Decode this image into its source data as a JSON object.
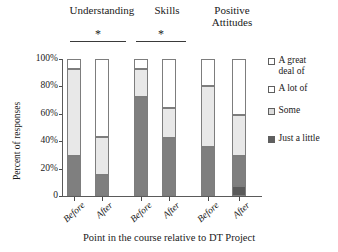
{
  "chart_data": {
    "type": "bar",
    "subtype": "100% stacked bar",
    "title": "",
    "xlabel": "Point in the course relative to DT Project",
    "ylabel": "Percent of responses",
    "ylim": [
      0,
      100
    ],
    "ytick_labels": [
      "0",
      "20%",
      "40%",
      "60%",
      "80%",
      "100%"
    ],
    "ytick_values": [
      0,
      20,
      40,
      60,
      80,
      100
    ],
    "grid": false,
    "legend_position": "right",
    "groups": [
      "Understanding",
      "Skills",
      "Positive\nAttitudes"
    ],
    "categories": [
      "Before",
      "After",
      "Before",
      "After",
      "Before",
      "After"
    ],
    "series": [
      {
        "name": "Just a little",
        "color": "#7f7f7f",
        "values": [
          29,
          15,
          72,
          42,
          36,
          7
        ]
      },
      {
        "name": "Some",
        "color": "#e6e6e6",
        "values": [
          64,
          42,
          21,
          22,
          44,
          22
        ]
      },
      {
        "name": "A lot of",
        "color": "#ffffff",
        "values": [
          7,
          43,
          7,
          36,
          20,
          71
        ]
      },
      {
        "name": "A great deal of",
        "color": "#ffffff",
        "values": [
          0,
          0,
          0,
          0,
          0,
          0
        ]
      }
    ],
    "bars": [
      {
        "group": "Understanding",
        "label": "Before",
        "segments": [
          {
            "name": "Just a little",
            "value": 29,
            "color": "#7f7f7f"
          },
          {
            "name": "Some",
            "value": 64,
            "color": "#e8e8e8"
          },
          {
            "name": "A lot of",
            "value": 7,
            "color": "#ffffff"
          }
        ]
      },
      {
        "group": "Understanding",
        "label": "After",
        "segments": [
          {
            "name": "Just a little",
            "value": 15,
            "color": "#7f7f7f"
          },
          {
            "name": "Some",
            "value": 28,
            "color": "#e8e8e8"
          },
          {
            "name": "A lot of",
            "value": 57,
            "color": "#ffffff"
          }
        ]
      },
      {
        "group": "Skills",
        "label": "Before",
        "segments": [
          {
            "name": "Just a little",
            "value": 72,
            "color": "#7f7f7f"
          },
          {
            "name": "Some",
            "value": 21,
            "color": "#e8e8e8"
          },
          {
            "name": "A lot of",
            "value": 7,
            "color": "#ffffff"
          }
        ]
      },
      {
        "group": "Skills",
        "label": "After",
        "segments": [
          {
            "name": "Just a little",
            "value": 42,
            "color": "#7f7f7f"
          },
          {
            "name": "Some",
            "value": 22,
            "color": "#e8e8e8"
          },
          {
            "name": "A lot of",
            "value": 36,
            "color": "#ffffff"
          }
        ]
      },
      {
        "group": "Positive Attitudes",
        "label": "Before",
        "segments": [
          {
            "name": "Just a little",
            "value": 36,
            "color": "#7f7f7f"
          },
          {
            "name": "Some",
            "value": 44,
            "color": "#e8e8e8"
          },
          {
            "name": "A lot of",
            "value": 20,
            "color": "#ffffff"
          }
        ]
      },
      {
        "group": "Positive Attitudes",
        "label": "After",
        "segments": [
          {
            "name": "A great deal of",
            "value": 7,
            "color": "#5a5a5a"
          },
          {
            "name": "Just a little",
            "value": 22,
            "color": "#7f7f7f"
          },
          {
            "name": "Some",
            "value": 30,
            "color": "#e8e8e8"
          },
          {
            "name": "A lot of",
            "value": 41,
            "color": "#ffffff"
          }
        ]
      }
    ],
    "annotations": [
      {
        "type": "significance",
        "text": "*",
        "group": "Understanding"
      },
      {
        "type": "significance",
        "text": "*",
        "group": "Skills"
      }
    ],
    "legend": [
      {
        "label": "A great\ndeal of",
        "swatch": "#ffffff"
      },
      {
        "label": "A lot of",
        "swatch": "#ffffff"
      },
      {
        "label": "Some",
        "swatch": "#dcdcdc"
      },
      {
        "label": "Just a little",
        "swatch": "#5f5f5f"
      }
    ]
  },
  "headers": {
    "understanding": "Understanding",
    "skills": "Skills",
    "positive_attitudes": "Positive\nAttitudes"
  },
  "significance": {
    "star_understanding": "*",
    "star_skills": "*"
  },
  "axes": {
    "y_title": "Percent of responses",
    "x_title": "Point in the course relative to DT Project",
    "yticks": [
      "100%",
      "80%",
      "60%",
      "40%",
      "20%",
      "0"
    ],
    "xticks": [
      "Before",
      "After",
      "Before",
      "After",
      "Before",
      "After"
    ]
  },
  "legend": {
    "items": [
      {
        "label": "A great\ndeal of"
      },
      {
        "label": "A lot of"
      },
      {
        "label": "Some"
      },
      {
        "label": "Just a little"
      }
    ]
  }
}
